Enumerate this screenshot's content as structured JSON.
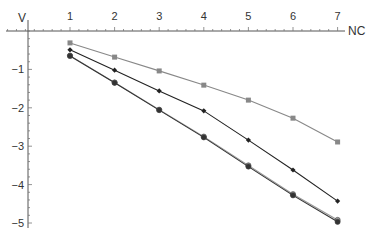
{
  "chart_data": {
    "type": "line",
    "title": "",
    "xlabel": "NC",
    "ylabel": "V",
    "x": [
      1,
      2,
      3,
      4,
      5,
      6,
      7
    ],
    "xlim": [
      0,
      7.3
    ],
    "ylim": [
      -5.1,
      0
    ],
    "x_ticks": [
      "1",
      "2",
      "3",
      "4",
      "5",
      "6",
      "7"
    ],
    "y_ticks": [
      "-1",
      "-2",
      "-3",
      "-4",
      "-5"
    ],
    "grid": false,
    "legend": null,
    "series": [
      {
        "name": "series-1",
        "marker": "square",
        "color": "#888888",
        "values": [
          -0.31,
          -0.68,
          -1.04,
          -1.41,
          -1.8,
          -2.27,
          -2.89
        ]
      },
      {
        "name": "series-2",
        "marker": "diamond",
        "color": "#222222",
        "values": [
          -0.49,
          -1.02,
          -1.56,
          -2.08,
          -2.84,
          -3.62,
          -4.43
        ]
      },
      {
        "name": "series-3",
        "marker": "circle",
        "color": "#999999",
        "values": [
          -0.64,
          -1.34,
          -2.05,
          -2.75,
          -3.5,
          -4.25,
          -4.92
        ]
      },
      {
        "name": "series-4",
        "marker": "circle",
        "color": "#333333",
        "values": [
          -0.65,
          -1.35,
          -2.06,
          -2.77,
          -3.53,
          -4.28,
          -4.97
        ]
      }
    ]
  },
  "axes": {
    "x_label": "NC",
    "y_label": "V"
  }
}
